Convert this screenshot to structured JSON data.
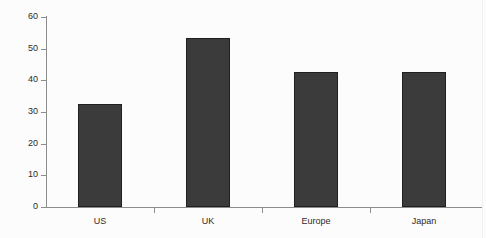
{
  "chart_data": {
    "type": "bar",
    "title": "",
    "xlabel": "",
    "ylabel": "",
    "categories": [
      "US",
      "UK",
      "Europe",
      "Japan"
    ],
    "values": [
      32.5,
      53.5,
      42.5,
      42.5
    ],
    "ylim": [
      0,
      60
    ],
    "yticks": [
      0,
      10,
      20,
      30,
      40,
      50,
      60
    ],
    "ytick_labels": [
      "0",
      "10",
      "20",
      "30",
      "40",
      "50",
      "60"
    ],
    "grid": false,
    "legend": null,
    "bar_color": "#3b3b3b",
    "bar_edge_color": "#1f1f1f",
    "axis_color": "#8c8c8c",
    "background_color": "#fcfcfc",
    "text_color": "#2b2b2b"
  }
}
